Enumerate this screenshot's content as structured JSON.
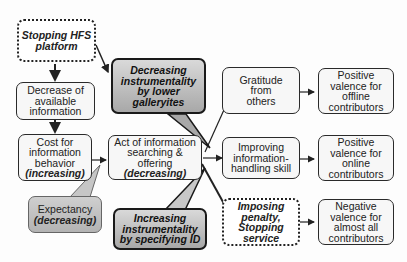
{
  "diagram": {
    "nodes": {
      "stopping_hfs": {
        "line1": "Stopping HFS",
        "line2": "platform"
      },
      "decrease_info": {
        "line1": "Decrease of",
        "line2": "available",
        "line3": "information"
      },
      "cost": {
        "line1": "Cost for",
        "line2": "information",
        "line3": "behavior",
        "line4": "(increasing)"
      },
      "expectancy": {
        "line1": "Expectancy",
        "line2": "(decreasing)"
      },
      "act": {
        "line1": "Act of information",
        "line2": "searching &",
        "line3": "offering",
        "line4": "(decreasing)"
      },
      "decreasing_instr": {
        "line1": "Decreasing",
        "line2": "instrumentality",
        "line3": "by lower",
        "line4": "galleryites"
      },
      "increasing_instr": {
        "line1": "Increasing",
        "line2": "instrumentality",
        "line3": "by specifying ID"
      },
      "gratitude": {
        "line1": "Gratitude",
        "line2": "from",
        "line3": "others"
      },
      "improving": {
        "line1": "Improving",
        "line2": "information-",
        "line3": "handling skill"
      },
      "penalty": {
        "line1": "Imposing",
        "line2": "penalty,",
        "line3": "Stopping",
        "line4": "service"
      },
      "pos_offline": {
        "line1": "Positive",
        "line2": "valence for",
        "line3": "offline",
        "line4": "contributors"
      },
      "pos_online": {
        "line1": "Positive",
        "line2": "valence for",
        "line3": "online",
        "line4": "contributors"
      },
      "negative": {
        "line1": "Negative",
        "line2": "valence for",
        "line3": "almost all",
        "line4": "contributors"
      }
    },
    "colors": {
      "border": "#2a2a2a",
      "box_fill": "#f7f7f7",
      "callout_top": "#d9d9d9",
      "callout_bottom": "#a8a8a8"
    }
  }
}
